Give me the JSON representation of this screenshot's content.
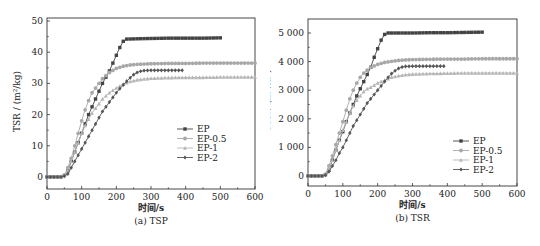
{
  "chart_data": [
    {
      "type": "line",
      "title": "(a) TSP",
      "xlabel": "时间/s",
      "ylabel": "TSR / (m²/kg)",
      "xlim": [
        0,
        600
      ],
      "ylim": [
        -4,
        50
      ],
      "xticks": [
        0,
        100,
        200,
        300,
        400,
        500,
        600
      ],
      "yticks": [
        0,
        10,
        20,
        30,
        40,
        50
      ],
      "ytick_labels": [
        "0",
        "10",
        "20",
        "30",
        "40",
        "50"
      ],
      "grid": false,
      "legend_position": "center-right",
      "series": [
        {
          "name": "EP",
          "marker": "square",
          "color": "#444444",
          "x": [
            0,
            40,
            50,
            60,
            70,
            80,
            90,
            100,
            110,
            120,
            130,
            140,
            150,
            160,
            170,
            180,
            190,
            200,
            210,
            220,
            230,
            260,
            300,
            350,
            400,
            450,
            500
          ],
          "y": [
            0,
            0,
            0.5,
            2,
            5,
            8,
            11,
            14,
            17,
            20,
            22.5,
            25,
            27.5,
            30,
            32,
            34,
            36.5,
            39,
            41.5,
            43.5,
            44.2,
            44.3,
            44.4,
            44.5,
            44.5,
            44.5,
            44.6
          ]
        },
        {
          "name": "EP-0.5",
          "marker": "circle",
          "color": "#a8a8a8",
          "x": [
            0,
            40,
            50,
            60,
            70,
            80,
            90,
            100,
            110,
            120,
            130,
            140,
            150,
            160,
            170,
            180,
            200,
            220,
            240,
            260,
            280,
            300,
            350,
            400,
            450,
            500,
            550,
            600
          ],
          "y": [
            0,
            0,
            0.5,
            3,
            6,
            10,
            14,
            18,
            21.5,
            24.5,
            27,
            28.5,
            30,
            31.5,
            32.5,
            33.5,
            34.8,
            35.5,
            35.9,
            36.1,
            36.2,
            36.3,
            36.4,
            36.4,
            36.5,
            36.5,
            36.5,
            36.5
          ]
        },
        {
          "name": "EP-1",
          "marker": "triangle",
          "color": "#b5b5b5",
          "x": [
            0,
            40,
            50,
            60,
            70,
            80,
            90,
            100,
            110,
            120,
            130,
            140,
            150,
            160,
            170,
            180,
            200,
            220,
            240,
            260,
            280,
            300,
            350,
            400,
            450,
            500,
            550,
            600
          ],
          "y": [
            0,
            0,
            0.5,
            2,
            5,
            8,
            11,
            14,
            16.5,
            18.5,
            20.5,
            22,
            23.5,
            25,
            26,
            27,
            28.5,
            29.8,
            30.6,
            31.1,
            31.4,
            31.6,
            31.8,
            31.9,
            31.9,
            32,
            32,
            32
          ]
        },
        {
          "name": "EP-2",
          "marker": "diamond",
          "color": "#555555",
          "x": [
            0,
            40,
            50,
            60,
            70,
            80,
            90,
            100,
            110,
            120,
            130,
            140,
            150,
            160,
            170,
            180,
            190,
            200,
            210,
            220,
            230,
            240,
            250,
            260,
            270,
            280,
            300,
            330,
            360,
            390
          ],
          "y": [
            0,
            0,
            0.3,
            1,
            3,
            5,
            7,
            9,
            11,
            13,
            15,
            17,
            19,
            21,
            22.5,
            24,
            25.5,
            27,
            28.3,
            29.5,
            30.7,
            31.8,
            32.8,
            33.5,
            33.9,
            34.1,
            34.2,
            34.2,
            34.2,
            34.2
          ]
        }
      ]
    },
    {
      "type": "line",
      "title": "(b) TSR",
      "xlabel": "时间/s",
      "ylabel": "TSR / (m²/m²)",
      "xlim": [
        0,
        600
      ],
      "ylim": [
        -400,
        5500
      ],
      "xticks": [
        0,
        100,
        200,
        300,
        400,
        500,
        600
      ],
      "yticks": [
        0,
        1000,
        2000,
        3000,
        4000,
        5000
      ],
      "ytick_labels": [
        "0",
        "1 000",
        "2 000",
        "3 000",
        "4 000",
        "5 000"
      ],
      "grid": false,
      "legend_position": "lower-right",
      "series": [
        {
          "name": "EP",
          "marker": "square",
          "color": "#444444",
          "x": [
            0,
            40,
            50,
            60,
            70,
            80,
            90,
            100,
            110,
            120,
            130,
            140,
            150,
            160,
            170,
            180,
            190,
            200,
            210,
            220,
            230,
            260,
            300,
            350,
            400,
            450,
            500
          ],
          "y": [
            0,
            0,
            50,
            200,
            550,
            900,
            1250,
            1550,
            1900,
            2200,
            2500,
            2800,
            3050,
            3300,
            3550,
            3800,
            4150,
            4450,
            4750,
            4950,
            5000,
            5000,
            5000,
            5010,
            5010,
            5020,
            5030
          ]
        },
        {
          "name": "EP-0.5",
          "marker": "circle",
          "color": "#a8a8a8",
          "x": [
            0,
            40,
            50,
            60,
            70,
            80,
            90,
            100,
            110,
            120,
            130,
            140,
            150,
            160,
            170,
            180,
            200,
            220,
            240,
            260,
            280,
            300,
            350,
            400,
            450,
            500,
            550,
            600
          ],
          "y": [
            0,
            0,
            60,
            350,
            700,
            1100,
            1500,
            1900,
            2300,
            2700,
            3000,
            3250,
            3450,
            3600,
            3700,
            3800,
            3900,
            3970,
            4010,
            4040,
            4060,
            4070,
            4080,
            4090,
            4090,
            4100,
            4100,
            4100
          ]
        },
        {
          "name": "EP-1",
          "marker": "triangle",
          "color": "#b5b5b5",
          "x": [
            0,
            40,
            50,
            60,
            70,
            80,
            90,
            100,
            110,
            120,
            130,
            140,
            150,
            160,
            170,
            180,
            200,
            220,
            240,
            260,
            280,
            300,
            350,
            400,
            450,
            500,
            550,
            600
          ],
          "y": [
            0,
            0,
            50,
            250,
            550,
            900,
            1250,
            1600,
            1900,
            2200,
            2450,
            2650,
            2800,
            2950,
            3050,
            3100,
            3250,
            3350,
            3450,
            3500,
            3540,
            3560,
            3580,
            3590,
            3600,
            3600,
            3600,
            3600
          ]
        },
        {
          "name": "EP-2",
          "marker": "diamond",
          "color": "#555555",
          "x": [
            0,
            40,
            50,
            60,
            70,
            80,
            90,
            100,
            110,
            120,
            130,
            140,
            150,
            160,
            170,
            180,
            190,
            200,
            210,
            220,
            230,
            240,
            250,
            260,
            270,
            280,
            300,
            330,
            360,
            390
          ],
          "y": [
            0,
            0,
            30,
            150,
            350,
            550,
            800,
            1000,
            1250,
            1500,
            1750,
            1950,
            2150,
            2350,
            2550,
            2700,
            2850,
            3000,
            3150,
            3300,
            3450,
            3580,
            3680,
            3760,
            3810,
            3830,
            3840,
            3840,
            3840,
            3840
          ]
        }
      ]
    }
  ],
  "panels": [
    {
      "caption": "(a) TSP",
      "xlabel": "时间/s",
      "ylabel": "TSR / (m²/kg)"
    },
    {
      "caption": "(b) TSR",
      "xlabel": "时间/s",
      "ylabel": "TSR / (m²/m²)"
    }
  ]
}
